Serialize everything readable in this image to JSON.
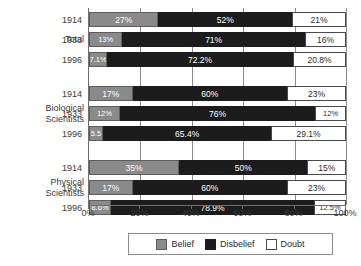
{
  "chart_data": {
    "type": "bar",
    "orientation": "horizontal",
    "stacked": true,
    "title": "",
    "xlabel": "",
    "ylabel": "",
    "xlim": [
      0,
      100
    ],
    "xticks": [
      "0%",
      "20%",
      "40%",
      "60%",
      "80%",
      "100%"
    ],
    "grid": true,
    "legend_position": "bottom",
    "series": [
      {
        "name": "Belief",
        "color": "#8a8a8a"
      },
      {
        "name": "Disbelief",
        "color": "#1c1c1c"
      },
      {
        "name": "Doubt",
        "color": "#ffffff"
      }
    ],
    "groups": [
      {
        "name": "Total",
        "rows": [
          {
            "year": "1914",
            "belief": 27,
            "disbelief": 52,
            "doubt": 21,
            "belief_label": "27%",
            "disbelief_label": "52%",
            "doubt_label": "21%"
          },
          {
            "year": "1933",
            "belief": 13,
            "disbelief": 71,
            "doubt": 16,
            "belief_label": "13%",
            "disbelief_label": "71%",
            "doubt_label": "16%"
          },
          {
            "year": "1996",
            "belief": 7.1,
            "disbelief": 72.2,
            "doubt": 20.8,
            "belief_label": "7.1%",
            "disbelief_label": "72.2%",
            "doubt_label": "20.8%"
          }
        ]
      },
      {
        "name": "Biological\nScientists",
        "name_line1": "Biological",
        "name_line2": "Scientists",
        "rows": [
          {
            "year": "1914",
            "belief": 17,
            "disbelief": 60,
            "doubt": 23,
            "belief_label": "17%",
            "disbelief_label": "60%",
            "doubt_label": "23%"
          },
          {
            "year": "1933",
            "belief": 12,
            "disbelief": 76,
            "doubt": 12,
            "belief_label": "12%",
            "disbelief_label": "76%",
            "doubt_label": "12%"
          },
          {
            "year": "1996",
            "belief": 5.5,
            "disbelief": 65.4,
            "doubt": 29.1,
            "belief_label": "5.5",
            "disbelief_label": "65.4%",
            "doubt_label": "29.1%"
          }
        ]
      },
      {
        "name": "Physical\nScientists",
        "name_line1": "Physical",
        "name_line2": "Scientists",
        "rows": [
          {
            "year": "1914",
            "belief": 35,
            "disbelief": 50,
            "doubt": 15,
            "belief_label": "35%",
            "disbelief_label": "50%",
            "doubt_label": "15%"
          },
          {
            "year": "1933",
            "belief": 17,
            "disbelief": 60,
            "doubt": 23,
            "belief_label": "17%",
            "disbelief_label": "60%",
            "doubt_label": "23%"
          },
          {
            "year": "1996",
            "belief": 8.6,
            "disbelief": 78.9,
            "doubt": 12.5,
            "belief_label": "8.6%",
            "disbelief_label": "78.9%",
            "doubt_label": "12.5%"
          }
        ]
      }
    ]
  },
  "legend": {
    "items": [
      {
        "label": "Belief"
      },
      {
        "label": "Disbelief"
      },
      {
        "label": "Doubt"
      }
    ]
  }
}
